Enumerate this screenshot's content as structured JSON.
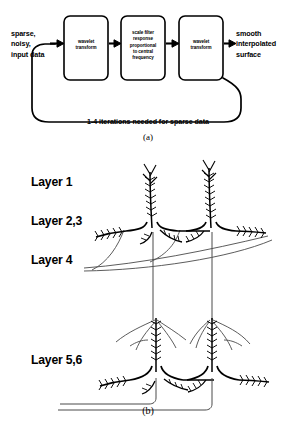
{
  "figure": {
    "panel_a": {
      "caption": "(a)",
      "input_label": "sparse,\nnoisy,\ninput data",
      "output_label": "smooth\ninterpolated\nsurface",
      "loop_caption": "1-4 iterations needed for sparse data",
      "boxes": [
        {
          "id": "box-wavelet-transform-1",
          "text": "wavelet\ntransform"
        },
        {
          "id": "box-scale-filter",
          "text": "scale filter\nresponse\nproportional\nto central\nfrequency"
        },
        {
          "id": "box-wavelet-transform-2",
          "text": "wavelet\ntransform"
        }
      ],
      "arrow_count": 4,
      "feedback_loop": "right-box output returns to left-box input"
    },
    "panel_b": {
      "caption": "(b)",
      "layer_labels": [
        {
          "id": "layer-1",
          "text": "Layer 1"
        },
        {
          "id": "layer-23",
          "text": "Layer 2,3"
        },
        {
          "id": "layer-4",
          "text": "Layer 4"
        },
        {
          "id": "layer-56",
          "text": "Layer 5,6"
        }
      ],
      "elements": {
        "upright_pyramidal_cells": 2,
        "inverted_pyramidal_cells": 2,
        "afferent_fibers": 2,
        "feedback_axons": 2
      }
    }
  },
  "colors": {
    "background": "#ffffff",
    "ink": "#000000",
    "thin_ink": "#4a4a4a"
  }
}
